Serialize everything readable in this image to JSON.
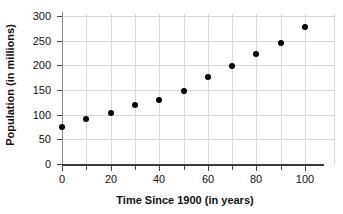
{
  "chart_data": {
    "type": "scatter",
    "title": "",
    "xlabel": "Time Since 1900 (in years)",
    "ylabel": "Population (in millions)",
    "x": [
      0,
      10,
      20,
      30,
      40,
      50,
      60,
      70,
      80,
      90,
      100
    ],
    "values": [
      75,
      91,
      104,
      120,
      129,
      148,
      176,
      199,
      223,
      245,
      277
    ],
    "series": [
      {
        "name": "Population",
        "values": [
          75,
          91,
          104,
          120,
          129,
          148,
          176,
          199,
          223,
          245,
          277
        ]
      }
    ],
    "points": [
      {
        "x": 0,
        "y": 75
      },
      {
        "x": 10,
        "y": 91
      },
      {
        "x": 20,
        "y": 104
      },
      {
        "x": 30,
        "y": 120
      },
      {
        "x": 40,
        "y": 129
      },
      {
        "x": 50,
        "y": 148
      },
      {
        "x": 60,
        "y": 176
      },
      {
        "x": 70,
        "y": 199
      },
      {
        "x": 80,
        "y": 223
      },
      {
        "x": 90,
        "y": 245
      },
      {
        "x": 100,
        "y": 277
      }
    ],
    "xlim": [
      -4,
      112
    ],
    "ylim": [
      0,
      305
    ],
    "xticks": [
      0,
      20,
      40,
      60,
      80,
      100
    ],
    "xticks_minor": [
      10,
      30,
      50,
      70,
      90
    ],
    "yticks": [
      0,
      50,
      100,
      150,
      200,
      250,
      300
    ],
    "xtick_labels": [
      "0",
      "20",
      "40",
      "60",
      "80",
      "100"
    ],
    "ytick_labels": [
      "0",
      "50",
      "100",
      "150",
      "200",
      "250",
      "300"
    ],
    "grid": true,
    "grid_color": "#d8d8d8",
    "marker_color": "#000000",
    "legend": null,
    "legend_position": "none",
    "annotations": []
  }
}
